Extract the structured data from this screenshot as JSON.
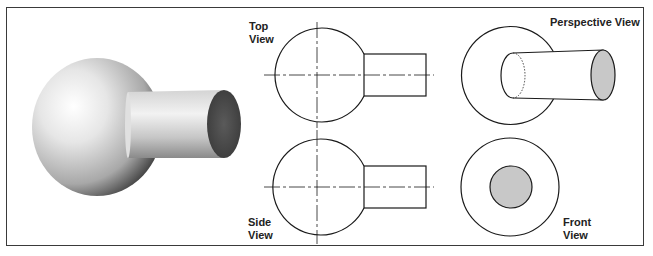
{
  "labels": {
    "top_view": [
      "Top",
      "View"
    ],
    "side_view": [
      "Side",
      "View"
    ],
    "perspective_view": "Perspective View",
    "front_view": [
      "Front",
      "View"
    ]
  },
  "colors": {
    "outline": "#1a1a1a",
    "face_fill": "#c8c8c8",
    "shaded_end": "#555555",
    "frame": "#3a3a3a"
  }
}
